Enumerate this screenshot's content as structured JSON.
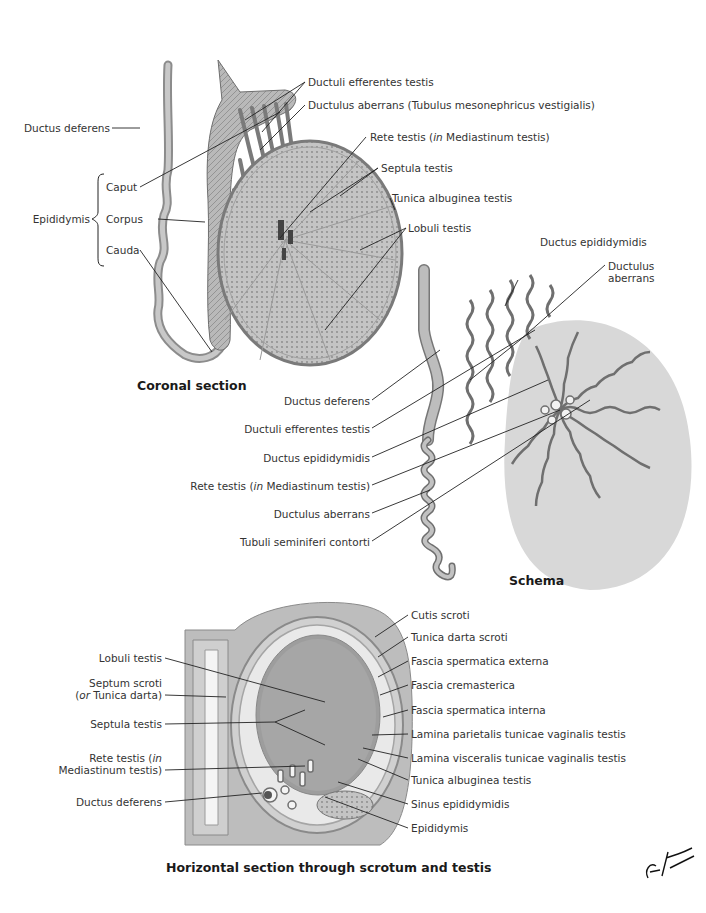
{
  "coronal": {
    "caption": "Coronal section",
    "labels": {
      "ductus_deferens": "Ductus deferens",
      "epididymis": "Epididymis",
      "caput": "Caput",
      "corpus": "Corpus",
      "cauda": "Cauda",
      "ductuli_efferentes": "Ductuli efferentes testis",
      "ductulus_aberrans_full": "Ductulus aberrans (Tubulus mesonephricus vestigialis)",
      "rete_pre": "Rete testis (",
      "rete_in": "in",
      "rete_post": " Mediastinum testis)",
      "septula": "Septula testis",
      "tunica_albuginea": "Tunica albuginea testis",
      "lobuli": "Lobuli testis"
    }
  },
  "schema": {
    "caption": "Schema",
    "labels": {
      "ductus_epididymidis_top": "Ductus epididymidis",
      "ductulus_aberrans_1": "Ductulus",
      "ductulus_aberrans_2": "aberrans",
      "ductus_deferens": "Ductus deferens",
      "ductuli_efferentes": "Ductuli efferentes testis",
      "ductus_epididymidis": "Ductus epididymidis",
      "rete_pre": "Rete testis (",
      "rete_in": "in",
      "rete_post": " Mediastinum testis)",
      "ductulus_aberrans": "Ductulus aberrans",
      "tubuli": "Tubuli seminiferi contorti"
    }
  },
  "horizontal": {
    "caption": "Horizontal section through scrotum and testis",
    "left_labels": {
      "lobuli": "Lobuli testis",
      "septum_1": "Septum scroti",
      "septum_2_pre": "(",
      "septum_2_or": "or",
      "septum_2_post": " Tunica darta)",
      "septula": "Septula testis",
      "rete_1_pre": "Rete testis (",
      "rete_1_in": "in",
      "rete_2": "Mediastinum testis)",
      "ductus_deferens": "Ductus deferens"
    },
    "right_labels": [
      "Cutis scroti",
      "Tunica darta scroti",
      "Fascia spermatica externa",
      "Fascia cremasterica",
      "Fascia spermatica interna",
      "Lamina parietalis tunicae vaginalis testis",
      "Lamina visceralis tunicae vaginalis testis",
      "Tunica albuginea testis",
      "Sinus epididymidis",
      "Epididymis"
    ]
  },
  "signature": "F. Netter M.D.",
  "colors": {
    "tissue_light": "#d6d6d6",
    "tissue_mid": "#a8a8a8",
    "tissue_dark": "#6e6e6e",
    "leader_line": "#222222"
  }
}
